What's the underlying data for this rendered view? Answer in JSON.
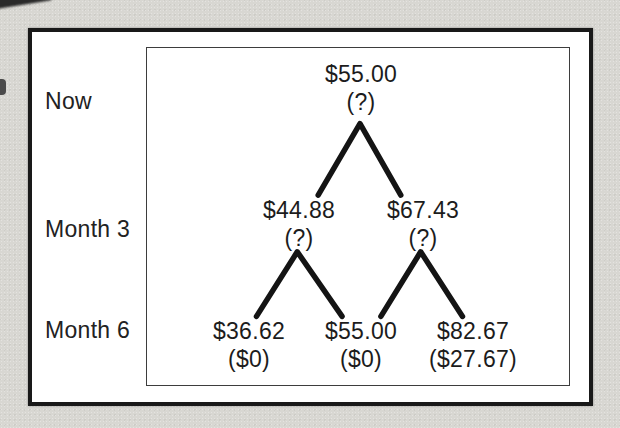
{
  "figure": {
    "rows": [
      {
        "label": "Now"
      },
      {
        "label": "Month 3"
      },
      {
        "label": "Month 6"
      }
    ],
    "tree": {
      "type": "binomial-tree",
      "description": "Two-period binomial tree: stock price with option value in parentheses at each node",
      "nodes": [
        {
          "id": "now",
          "period": "Now",
          "price": "$55.00",
          "value": "(?)"
        },
        {
          "id": "month3-down",
          "period": "Month 3",
          "price": "$44.88",
          "value": "(?)"
        },
        {
          "id": "month3-up",
          "period": "Month 3",
          "price": "$67.43",
          "value": "(?)"
        },
        {
          "id": "month6-down",
          "period": "Month 6",
          "price": "$36.62",
          "value": "($0)"
        },
        {
          "id": "month6-mid",
          "period": "Month 6",
          "price": "$55.00",
          "value": "($0)"
        },
        {
          "id": "month6-up",
          "period": "Month 6",
          "price": "$82.67",
          "value": "($27.67)"
        }
      ],
      "edges": [
        {
          "from": "now",
          "to": "month3-down"
        },
        {
          "from": "now",
          "to": "month3-up"
        },
        {
          "from": "month3-down",
          "to": "month6-down"
        },
        {
          "from": "month3-down",
          "to": "month6-mid"
        },
        {
          "from": "month3-up",
          "to": "month6-mid"
        },
        {
          "from": "month3-up",
          "to": "month6-up"
        }
      ]
    },
    "colors": {
      "page_background": "#d8d7d2",
      "panel_background": "#ffffff",
      "frame_border": "#191919",
      "inner_border": "#3d3d3d",
      "branch_line": "#141414",
      "text": "#1e1e1e"
    }
  }
}
